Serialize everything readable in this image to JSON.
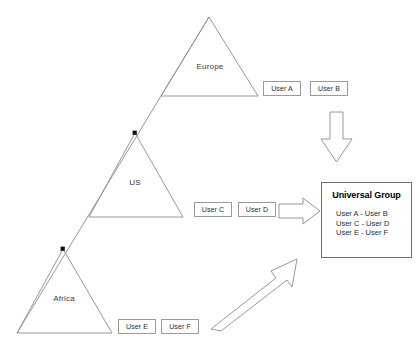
{
  "diagram": {
    "type": "org-hierarchy-to-group-diagram",
    "background_color": "#ffffff",
    "line_color": "#8c8c8c",
    "text_color": "#2a2a2a"
  },
  "regions": [
    {
      "id": "europe",
      "label": "Europe",
      "apex": [
        209,
        17
      ],
      "base_left": [
        161,
        96
      ],
      "base_right": [
        258,
        96
      ]
    },
    {
      "id": "us",
      "label": "US",
      "apex": [
        135,
        133
      ],
      "base_left": [
        89,
        217
      ],
      "base_right": [
        183,
        217
      ]
    },
    {
      "id": "africa",
      "label": "Africa",
      "apex": [
        63,
        249
      ],
      "base_left": [
        17,
        333
      ],
      "base_right": [
        112,
        333
      ]
    }
  ],
  "spine": {
    "from": [
      209,
      17
    ],
    "to": [
      17,
      333
    ],
    "junction_dots": [
      [
        135,
        133
      ],
      [
        63,
        249
      ]
    ]
  },
  "users": [
    {
      "id": "user-a",
      "label": "User A",
      "region": "europe"
    },
    {
      "id": "user-b",
      "label": "User B",
      "region": "europe"
    },
    {
      "id": "user-c",
      "label": "User C",
      "region": "us"
    },
    {
      "id": "user-d",
      "label": "User D",
      "region": "us"
    },
    {
      "id": "user-e",
      "label": "User E",
      "region": "africa"
    },
    {
      "id": "user-f",
      "label": "User F",
      "region": "africa"
    }
  ],
  "arrows": [
    {
      "id": "arrow-down",
      "direction": "down",
      "from_region": "europe",
      "to": "universal-group"
    },
    {
      "id": "arrow-right",
      "direction": "right",
      "from_region": "us",
      "to": "universal-group"
    },
    {
      "id": "arrow-diagonal",
      "direction": "up-right",
      "from_region": "africa",
      "to": "universal-group"
    }
  ],
  "universal_group": {
    "title": "Universal Group",
    "members": [
      "User A - User B",
      "User C - User D",
      "User E - User F"
    ]
  }
}
